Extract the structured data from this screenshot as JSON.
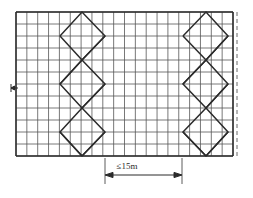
{
  "figure": {
    "type": "technical-line-drawing",
    "colors": {
      "line": "#3a3a3a",
      "grid": "#555555",
      "outline": "#2b2b2b",
      "dash": "#6b6b6b",
      "background": "#ffffff",
      "text": "#2b2b2b"
    },
    "frame": {
      "x0": 16,
      "y0": 12,
      "x1": 233,
      "y1": 156,
      "vertical_bays": 20,
      "horizontal_levels": 12
    },
    "grid": {
      "vertical_step": 10.85,
      "horizontal_step": 12.0
    },
    "bracing": [
      {
        "name": "left-brace",
        "x_left": 60,
        "x_right": 105
      },
      {
        "name": "right-brace",
        "x_left": 183,
        "x_right": 228
      }
    ],
    "brace_nodes_y": [
      12,
      36,
      60,
      84,
      108,
      132,
      156
    ],
    "right_edge_dashed": {
      "x": 236,
      "y0": 12,
      "y1": 156
    },
    "left_edge_tick": {
      "x": 16,
      "y": 88
    }
  },
  "dimension": {
    "label": "≤15m",
    "value": "15",
    "unit": "m",
    "operator": "≤",
    "line_y": 175,
    "x_start": 105,
    "x_end": 182,
    "extension_top": 158,
    "extension_bottom": 183
  }
}
